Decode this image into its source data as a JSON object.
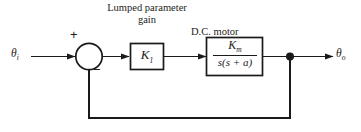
{
  "diagram": {
    "type": "control-system-block-diagram",
    "width": 361,
    "height": 132,
    "background_color": "#ffffff",
    "line_color": "#1a1a1a"
  },
  "signals": {
    "input": {
      "symbol": "θ",
      "subscript": "i",
      "name": "input-signal-theta-i"
    },
    "output": {
      "symbol": "θ",
      "subscript": "o",
      "name": "output-signal-theta-o"
    }
  },
  "summing_junction": {
    "name": "summing-junction",
    "plus_sign": "+",
    "minus_sign": "−",
    "positive_input": "input",
    "negative_input": "feedback"
  },
  "blocks": [
    {
      "id": "gain",
      "caption": "Lumped parameter gain",
      "caption_lines": [
        "Lumped",
        "parameter",
        "gain"
      ],
      "symbol": "K",
      "subscript": "1",
      "transfer_function": "K₁"
    },
    {
      "id": "motor",
      "caption": "D.C. motor",
      "numerator": "K",
      "numerator_subscript": "m",
      "denominator": "s(s + a)",
      "transfer_function": "Kₘ / s(s + a)"
    }
  ],
  "feedback": {
    "name": "unity-feedback-path",
    "takeoff_point_label": "takeoff-node",
    "gain": "1"
  }
}
